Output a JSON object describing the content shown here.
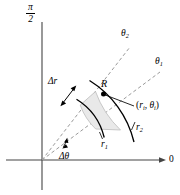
{
  "figure": {
    "background_color": "#ffffff",
    "line_color": "#000000",
    "dashed_ray_color": "#9a9a9a",
    "region_fill_color": "#e8e8e8",
    "region_stroke_color": "#b4b4b4"
  },
  "axes": {
    "vertical_label": {
      "numerator": "π",
      "denominator": "2"
    },
    "horizontal_label": "0",
    "origin": {
      "x": 42,
      "y": 160
    }
  },
  "labels": {
    "theta2": {
      "base": "θ",
      "sub": "2"
    },
    "theta1": {
      "base": "θ",
      "sub": "1"
    },
    "delta_r": "Δr",
    "region": "R",
    "point": {
      "open": "(",
      "r": "r",
      "r_sub": "i",
      "comma": ", ",
      "theta": "θ",
      "theta_sub": "i",
      "close": ")"
    },
    "r2": {
      "base": "r",
      "sub": "2"
    },
    "r1": {
      "base": "r",
      "sub": "1"
    },
    "delta_theta": "Δθ"
  },
  "geometry": {
    "inner_radius": 62,
    "outer_radius": 100,
    "theta1_deg": 30,
    "theta2_deg": 52,
    "sample_point": {
      "x": 103,
      "y": 94
    }
  }
}
